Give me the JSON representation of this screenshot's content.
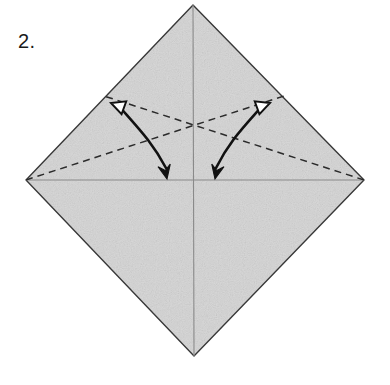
{
  "figure": {
    "kind": "origami-fold-diagram",
    "step_label": "2.",
    "canvas": {
      "width": 390,
      "height": 385
    },
    "background_color": "#ffffff"
  },
  "paper": {
    "name": "square-rotated-45",
    "fill_color": "#d8d8d8",
    "outline_color": "#3a3a3a",
    "outline_width": 1.4,
    "vertices": {
      "top": {
        "x": 193,
        "y": 5
      },
      "right": {
        "x": 364,
        "y": 180
      },
      "bottom": {
        "x": 194,
        "y": 356
      },
      "left": {
        "x": 26,
        "y": 180
      }
    },
    "polygon_points": "193,5 364,180 194,356 26,180"
  },
  "crease_lines": {
    "existing_color": "#8a8a8a",
    "existing_width": 1.1,
    "vertical": {
      "x1": 193,
      "y1": 5,
      "x2": 194,
      "y2": 356,
      "name": "vertical-center-crease"
    },
    "horizontal": {
      "x1": 26,
      "y1": 180,
      "x2": 364,
      "y2": 180,
      "name": "horizontal-center-crease"
    }
  },
  "fold_lines": {
    "style": "dashed",
    "color": "#2b2b2b",
    "width": 1.5,
    "dash_pattern": "7,5",
    "lines": [
      {
        "name": "valley-fold-left-to-upper-right",
        "x1": 26,
        "y1": 180,
        "x2": 284,
        "y2": 96
      },
      {
        "name": "valley-fold-right-to-upper-left",
        "x1": 364,
        "y1": 180,
        "x2": 104,
        "y2": 96
      }
    ],
    "intersection": {
      "x": 193,
      "y": 108
    }
  },
  "motion_arrows": {
    "stroke_color": "#111111",
    "stroke_width": 2.6,
    "items": [
      {
        "name": "fold-arrow-left",
        "path": "M 118,105 C 140,130 152,142 166,168",
        "head_start": {
          "name": "hollow-arrowhead-left",
          "type": "hollow-triangle",
          "x": 111,
          "y": 103,
          "rotation_deg": 200,
          "size": 11,
          "fill": "#ffffff",
          "stroke": "#111111"
        },
        "head_end": {
          "name": "solid-arrowhead-down-left",
          "type": "solid-triangle",
          "x": 167,
          "y": 179,
          "rotation_deg": 78,
          "size": 12,
          "fill": "#111111",
          "stroke": "#111111"
        }
      },
      {
        "name": "fold-arrow-right",
        "path": "M 263,105 C 241,130 229,142 216,168",
        "head_start": {
          "name": "hollow-arrowhead-right",
          "type": "hollow-triangle",
          "x": 270,
          "y": 103,
          "rotation_deg": -20,
          "size": 11,
          "fill": "#ffffff",
          "stroke": "#111111"
        },
        "head_end": {
          "name": "solid-arrowhead-down-right",
          "type": "solid-triangle",
          "x": 215,
          "y": 179,
          "rotation_deg": 102,
          "size": 12,
          "fill": "#111111",
          "stroke": "#111111"
        }
      }
    ]
  }
}
